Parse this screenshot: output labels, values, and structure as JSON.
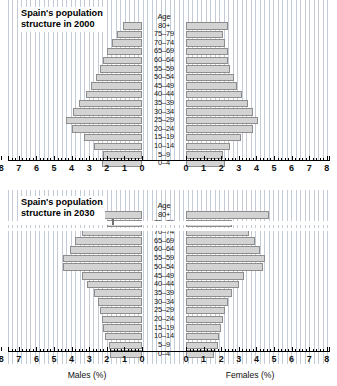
{
  "figure": {
    "age_header": "Age",
    "age_groups": [
      "80+",
      "75–79",
      "70–74",
      "65–69",
      "60–64",
      "55–59",
      "50–54",
      "45–49",
      "40–44",
      "35–39",
      "30–34",
      "25–29",
      "20–24",
      "15–19",
      "10–14",
      "5–9",
      "0–4"
    ],
    "axis_ticks": [
      "8",
      "7",
      "6",
      "5",
      "4",
      "3",
      "2",
      "1",
      "0",
      "0",
      "1",
      "2",
      "3",
      "4",
      "5",
      "6",
      "7",
      "8"
    ],
    "male_axis_label": "Males (%)",
    "female_axis_label": "Females (%)",
    "bar_fill": "#d3d3d3",
    "bar_stroke": "#8d8d8d",
    "grid_color": "#c3ccd6"
  },
  "panels": [
    {
      "id": "panel-2000",
      "title": "Spain's population\nstructure in 2000"
    },
    {
      "id": "panel-2030",
      "title": "Spain's population\nstructure in 2030"
    }
  ],
  "chart_data": [
    {
      "type": "bar",
      "title": "Spain's population structure in 2000",
      "subtitle": "Population pyramid",
      "orientation": "horizontal-diverging",
      "categories": [
        "80+",
        "75–79",
        "70–74",
        "65–69",
        "60–64",
        "55–59",
        "50–54",
        "45–49",
        "40–44",
        "35–39",
        "30–34",
        "25–29",
        "20–24",
        "15–19",
        "10–14",
        "5–9",
        "0–4"
      ],
      "series": [
        {
          "name": "Males (%)",
          "side": "left",
          "values": [
            1.1,
            1.4,
            1.7,
            2.0,
            2.2,
            2.4,
            2.6,
            2.9,
            3.2,
            3.6,
            3.9,
            4.3,
            4.0,
            3.3,
            2.7,
            2.2,
            2.3
          ]
        },
        {
          "name": "Females (%)",
          "side": "right",
          "values": [
            2.4,
            2.1,
            2.2,
            2.4,
            2.4,
            2.5,
            2.7,
            2.9,
            3.2,
            3.5,
            3.8,
            4.1,
            3.8,
            3.1,
            2.5,
            2.1,
            2.2
          ]
        }
      ],
      "xlabel_left": "Males (%)",
      "xlabel_right": "Females (%)",
      "ylabel": "Age",
      "xlim": [
        0,
        8
      ],
      "xtick_values": [
        0,
        1,
        2,
        3,
        4,
        5,
        6,
        7,
        8
      ],
      "grid": true,
      "legend": "none"
    },
    {
      "type": "bar",
      "title": "Spain's population structure in 2030",
      "subtitle": "Population pyramid (projection)",
      "orientation": "horizontal-diverging",
      "categories": [
        "80+",
        "75–79",
        "70–74",
        "65–69",
        "60–64",
        "55–59",
        "50–54",
        "45–49",
        "40–44",
        "35–39",
        "30–34",
        "25–29",
        "20–24",
        "15–19",
        "10–14",
        "5–9",
        "0–4"
      ],
      "series": [
        {
          "name": "Males (%)",
          "side": "left",
          "values": [
            2.6,
            2.0,
            3.4,
            3.8,
            4.1,
            4.5,
            4.5,
            3.4,
            3.1,
            2.7,
            2.5,
            2.4,
            2.3,
            2.2,
            2.1,
            1.9,
            1.8
          ]
        },
        {
          "name": "Females (%)",
          "side": "right",
          "values": [
            4.7,
            2.6,
            3.6,
            3.9,
            4.2,
            4.5,
            4.4,
            3.3,
            3.0,
            2.6,
            2.4,
            2.2,
            2.1,
            2.0,
            1.9,
            1.8,
            1.6
          ]
        }
      ],
      "xlabel_left": "Males (%)",
      "xlabel_right": "Females (%)",
      "ylabel": "Age",
      "xlim": [
        0,
        8
      ],
      "xtick_values": [
        0,
        1,
        2,
        3,
        4,
        5,
        6,
        7,
        8
      ],
      "grid": true,
      "legend": "none",
      "render_artifact": "horizontal white band clipping the 75–79 row"
    }
  ]
}
